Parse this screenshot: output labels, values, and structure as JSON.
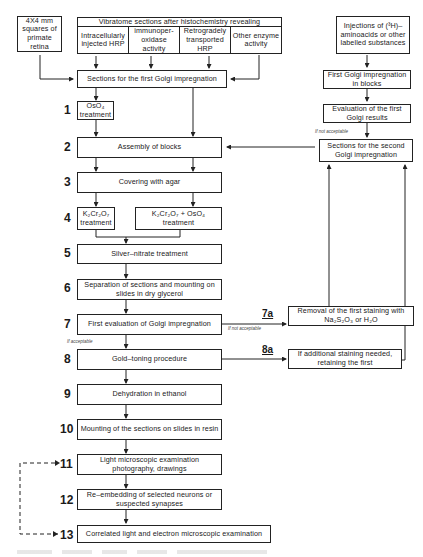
{
  "diagram": {
    "type": "flowchart",
    "top": {
      "retina_box": "4X4 mm squares of primate retina",
      "vibratome_header": "Vibratome sections after histochemistry revealing",
      "vibratome_cells": [
        "Intracellularly injected HRP",
        "immunoper-oxidase activity",
        "Retrogradely transported HRP",
        "Other enzyme activity"
      ],
      "injections_box": "Injections of (³H)–aminoacids or other labelled substances",
      "first_sections": "Sections for the first Golgi impregnation"
    },
    "right_branch": {
      "first_golgi_blocks": "First Golgi impregnation in blocks",
      "evaluation_first": "Evaluation of the first Golgi results",
      "not_acceptable_note": "If not acceptable",
      "second_sections": "Sections for the second Golgi impregnation"
    },
    "steps": [
      {
        "num": "1",
        "text": "OsO₄ treatment"
      },
      {
        "num": "2",
        "text": "Assembly of blocks"
      },
      {
        "num": "3",
        "text": "Covering with agar"
      },
      {
        "num": "4",
        "text_a": "K₂Cr₂O₇ treatment",
        "text_b": "K₂Cr₂O₇ + OsO₄ treatment"
      },
      {
        "num": "5",
        "text": "Silver–nitrate treatment"
      },
      {
        "num": "6",
        "text": "Separation of sections and mounting on slides in dry glycerol"
      },
      {
        "num": "7",
        "text": "First evaluation of Golgi impregnation"
      },
      {
        "num": "8",
        "text": "Gold–toning procedure"
      },
      {
        "num": "9",
        "text": "Dehydration in ethanol"
      },
      {
        "num": "10",
        "text": "Mounting of the sections on slides in resin"
      },
      {
        "num": "11",
        "text": "Light microscopic examination photography, drawings"
      },
      {
        "num": "12",
        "text": "Re–embedding of selected neurons or suspected synapses"
      },
      {
        "num": "13",
        "text": "Correlated light and electron microscopic examination"
      }
    ],
    "side_steps": {
      "7a": {
        "label": "7a",
        "text": "Removal of the first staining with Na₂S₂O₃ or H₂O",
        "note": "If not acceptable"
      },
      "8a": {
        "label": "8a",
        "text": "If additional staining needed, retaining the first"
      }
    },
    "accept_note": "If acceptable"
  }
}
